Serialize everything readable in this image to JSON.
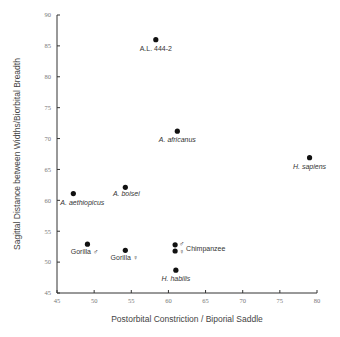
{
  "chart_data": {
    "type": "scatter",
    "title": "",
    "xlabel": "Postorbital Constriction / Biporial Saddle",
    "ylabel": "Sagittal Distance between Widths/Biorbital Breadth",
    "xlim": [
      45,
      80
    ],
    "ylim": [
      45,
      90
    ],
    "xticks": [
      45,
      50,
      55,
      60,
      65,
      70,
      75,
      80
    ],
    "yticks": [
      45,
      50,
      55,
      60,
      65,
      70,
      75,
      80,
      85,
      90
    ],
    "grid": false,
    "legend": null,
    "points": [
      {
        "label": "A.L. 444-2",
        "x": 58.3,
        "y": 86.0,
        "italic": false,
        "lx": 0,
        "ly": 11,
        "anchor": "middle"
      },
      {
        "label": "A. africanus",
        "x": 61.2,
        "y": 71.2,
        "italic": true,
        "lx": 0,
        "ly": 11,
        "anchor": "middle"
      },
      {
        "label": "H. sapiens",
        "x": 79.0,
        "y": 66.9,
        "italic": true,
        "lx": 0,
        "ly": 11,
        "anchor": "middle"
      },
      {
        "label": "A. aethiopicus",
        "x": 47.2,
        "y": 61.1,
        "italic": true,
        "lx": 9,
        "ly": 11,
        "anchor": "middle"
      },
      {
        "label": "A. boisei",
        "x": 54.2,
        "y": 62.1,
        "italic": true,
        "lx": 1,
        "ly": 9,
        "anchor": "middle"
      },
      {
        "label": "Gorilla ♂",
        "x": 49.1,
        "y": 52.9,
        "italic": false,
        "lx": -3,
        "ly": 10,
        "anchor": "middle"
      },
      {
        "label": "Gorilla ♀",
        "x": 54.2,
        "y": 51.9,
        "italic": false,
        "lx": -1,
        "ly": 10,
        "anchor": "middle"
      },
      {
        "label": "♂",
        "x": 60.9,
        "y": 52.8,
        "italic": false,
        "lx": 4,
        "ly": 1,
        "anchor": "start"
      },
      {
        "label": "♀",
        "x": 60.9,
        "y": 51.8,
        "italic": false,
        "lx": 4,
        "ly": 3,
        "anchor": "start"
      },
      {
        "label": "H. habilis",
        "x": 61.0,
        "y": 48.7,
        "italic": true,
        "lx": 0,
        "ly": 11,
        "anchor": "middle"
      }
    ],
    "annotations": [
      {
        "text": "Chimpanzee",
        "x": 60.9,
        "y": 52.3,
        "dx": 11,
        "dy": 3
      }
    ]
  }
}
